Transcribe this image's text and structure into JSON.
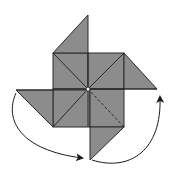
{
  "diagram": {
    "title": "Origami pinwheel folding step",
    "colors": {
      "paper_fill": "#8c8c8c",
      "fold_line": "#2a2a2a",
      "arrow": "#1a1a1a",
      "background": "#ffffff"
    },
    "center": [
      88,
      89
    ],
    "flaps": [
      {
        "name": "top",
        "points": [
          [
            53,
            53
          ],
          [
            88,
            15
          ],
          [
            88,
            53
          ]
        ]
      },
      {
        "name": "right",
        "points": [
          [
            124,
            53
          ],
          [
            157,
            89
          ],
          [
            124,
            89
          ]
        ]
      },
      {
        "name": "bottom",
        "points": [
          [
            124,
            127
          ],
          [
            90,
            160
          ],
          [
            90,
            127
          ]
        ]
      },
      {
        "name": "left",
        "points": [
          [
            53,
            127
          ],
          [
            16,
            90
          ],
          [
            53,
            90
          ]
        ]
      }
    ],
    "arrows": [
      {
        "name": "left-arrow",
        "from": [
          16,
          93
        ],
        "to": [
          84,
          158
        ]
      },
      {
        "name": "right-arrow",
        "from": [
          92,
          160
        ],
        "to": [
          160,
          96
        ]
      }
    ]
  }
}
